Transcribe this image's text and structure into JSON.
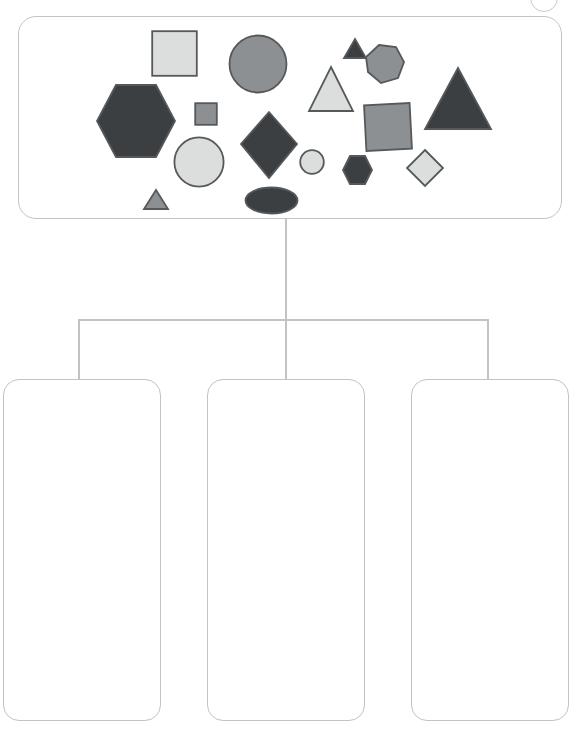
{
  "page": {
    "kind": "shape-sorting-worksheet",
    "canvas_width": 577,
    "canvas_height": 735
  },
  "palette": {
    "outline_gray": "#c2c3c4",
    "shape_stroke": "#55595c",
    "dark_fill": "#3b3f42",
    "mid_fill": "#8d9093",
    "light_fill": "#dcdddd",
    "background": "#ffffff"
  },
  "top_badge": {
    "name": "partial-circle-badge",
    "visible_label": ""
  },
  "source_container": {
    "label": "",
    "shape_count": 17,
    "shapes": [
      {
        "id": 1,
        "kind": "square",
        "fill": "light",
        "size": "large",
        "label": ""
      },
      {
        "id": 2,
        "kind": "square",
        "fill": "mid",
        "size": "small",
        "label": ""
      },
      {
        "id": 3,
        "kind": "square",
        "fill": "mid",
        "size": "large",
        "label": ""
      },
      {
        "id": 4,
        "kind": "hexagon",
        "fill": "dark",
        "size": "large",
        "label": ""
      },
      {
        "id": 5,
        "kind": "hexagon",
        "fill": "mid",
        "size": "medium",
        "label": ""
      },
      {
        "id": 6,
        "kind": "hexagon",
        "fill": "dark",
        "size": "small",
        "label": ""
      },
      {
        "id": 7,
        "kind": "circle",
        "fill": "mid",
        "size": "large",
        "label": ""
      },
      {
        "id": 8,
        "kind": "circle",
        "fill": "light",
        "size": "medium",
        "label": ""
      },
      {
        "id": 9,
        "kind": "circle",
        "fill": "light",
        "size": "small",
        "label": ""
      },
      {
        "id": 10,
        "kind": "ellipse",
        "fill": "dark",
        "size": "medium",
        "label": ""
      },
      {
        "id": 11,
        "kind": "triangle",
        "fill": "dark",
        "size": "tiny",
        "label": ""
      },
      {
        "id": 12,
        "kind": "triangle",
        "fill": "light",
        "size": "medium",
        "label": ""
      },
      {
        "id": 13,
        "kind": "triangle",
        "fill": "dark",
        "size": "large",
        "label": ""
      },
      {
        "id": 14,
        "kind": "triangle",
        "fill": "mid",
        "size": "tiny",
        "label": ""
      },
      {
        "id": 15,
        "kind": "diamond",
        "fill": "dark",
        "size": "large",
        "label": ""
      },
      {
        "id": 16,
        "kind": "diamond",
        "fill": "light",
        "size": "small",
        "label": ""
      },
      {
        "id": 17,
        "kind": "pentagon",
        "fill": "mid",
        "size": "medium",
        "label": ""
      }
    ]
  },
  "buckets": [
    {
      "id": "bucket-1",
      "label": "",
      "items": []
    },
    {
      "id": "bucket-2",
      "label": "",
      "items": []
    },
    {
      "id": "bucket-3",
      "label": "",
      "items": []
    }
  ],
  "connectors": {
    "type": "tree",
    "parent": "source-container",
    "children": [
      "bucket-1",
      "bucket-2",
      "bucket-3"
    ]
  }
}
